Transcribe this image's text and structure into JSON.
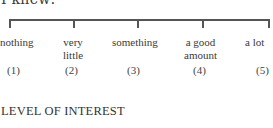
{
  "top_text": "I knew:",
  "scale": {
    "points": [
      {
        "label_line1": "nothing",
        "label_line2": "",
        "number": "(1)"
      },
      {
        "label_line1": "very",
        "label_line2": "little",
        "number": "(2)"
      },
      {
        "label_line1": "something",
        "label_line2": "",
        "number": "(3)"
      },
      {
        "label_line1": "a good",
        "label_line2": "amount",
        "number": "(4)"
      },
      {
        "label_line1": "a lot",
        "label_line2": "",
        "number": "(5)"
      }
    ]
  },
  "section_heading": "LEVEL OF INTEREST"
}
